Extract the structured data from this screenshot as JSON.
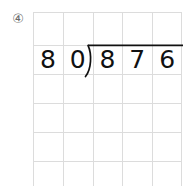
{
  "page": {
    "background_color": "#ffffff",
    "width": 186,
    "height": 186
  },
  "problem": {
    "number_label": "④",
    "number_color": "#6b6b6b",
    "type": "long-division",
    "divisor": "80",
    "dividend": "876",
    "quotient": "",
    "operator_symbol": "long-division-bracket"
  },
  "grid": {
    "line_color": "#dcdcdc",
    "columns": 5,
    "rows": 6,
    "cell_width": 29.8,
    "cell_height": 29,
    "origin_x": 33,
    "origin_y": 12
  },
  "digits": {
    "cells": [
      {
        "label": "8",
        "column": 0,
        "role": "divisor-tens"
      },
      {
        "label": "0",
        "column": 1,
        "role": "divisor-ones"
      },
      {
        "label": "8",
        "column": 2,
        "role": "dividend-hundreds"
      },
      {
        "label": "7",
        "column": 3,
        "role": "dividend-tens"
      },
      {
        "label": "6",
        "column": 4,
        "role": "dividend-ones"
      }
    ],
    "color": "#111111",
    "font_size": 25
  },
  "bracket": {
    "stroke_color": "#111111",
    "stroke_width": 1.6,
    "vinculum_start_x": 88,
    "vinculum_end_x": 183,
    "vinculum_y": 45
  }
}
